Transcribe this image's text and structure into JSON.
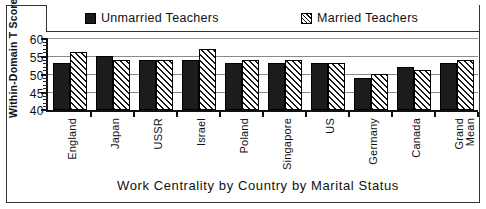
{
  "chart_data": {
    "type": "bar",
    "title": "",
    "xlabel": "Work  Centrality  by  Country  by  Marital  Status",
    "ylabel": "Within-Domain T Scores",
    "ylim": [
      40,
      60
    ],
    "yticks": [
      40,
      45,
      50,
      55,
      60
    ],
    "ytick_labels": [
      "40",
      "45",
      "50",
      "55",
      "60"
    ],
    "minor_tick_step": 1,
    "grid": true,
    "grid_axis": "y",
    "legend_position": "top",
    "categories": [
      "England",
      "Japan",
      "USSR",
      "Israel",
      "Poland",
      "Singapore",
      "US",
      "Germany",
      "Canada",
      "Grand Mean"
    ],
    "series": [
      {
        "name": "Unmarried  Teachers",
        "fill": "solid",
        "color": "#1c1c1c",
        "values": [
          53,
          55,
          54,
          54,
          53,
          53,
          53,
          49,
          52,
          53
        ]
      },
      {
        "name": "Married  Teachers",
        "fill": "hatched",
        "color": "#ffffff",
        "values": [
          56,
          54,
          54,
          57,
          54,
          54,
          53,
          50,
          51,
          54
        ]
      }
    ]
  },
  "legend": {
    "items": [
      {
        "label": "Unmarried  Teachers",
        "swatch": "solid-square-icon"
      },
      {
        "label": "Married  Teachers",
        "swatch": "hatched-square-icon"
      }
    ]
  },
  "axes": {
    "y_title": "Within-Domain T Scores",
    "x_title": "Work  Centrality  by  Country  by  Marital  Status",
    "y_tick_labels": [
      "60",
      "55",
      "50",
      "45",
      "40"
    ],
    "x_tick_labels": [
      "England",
      "Japan",
      "USSR",
      "Israel",
      "Poland",
      "Singapore",
      "US",
      "Germany",
      "Canada",
      "Grand",
      "Mean"
    ]
  }
}
